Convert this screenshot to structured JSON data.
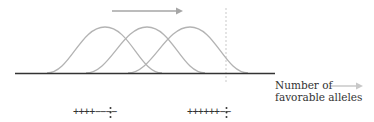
{
  "diagram": {
    "axis_label_line1": "Number of",
    "axis_label_line2": "favorable alleles",
    "curves": [
      {
        "peak_x": 105,
        "label": "distribution-1"
      },
      {
        "peak_x": 147,
        "label": "distribution-2"
      },
      {
        "peak_x": 190,
        "label": "distribution-3"
      }
    ],
    "left_genotypes": [
      "++++−−−−",
      "−+−−++−−"
    ],
    "right_genotypes": [
      "++++++−−",
      "+−++++ +−"
    ],
    "ellipsis": "⋮",
    "colors": {
      "curve": "#b3b3b3",
      "baseline": "#333333",
      "arrow": "#a6a6a6",
      "dashed": "#bbbbbb",
      "text": "#333333"
    }
  }
}
